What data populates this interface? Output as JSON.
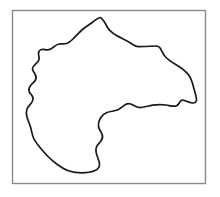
{
  "figure": {
    "title": "Hand-drawn closed outline figure",
    "background_color": "#ffffff",
    "canvas": {
      "width": 220,
      "height": 197
    },
    "frame": {
      "name": "border-rectangle",
      "x": 12.5,
      "y": 10.5,
      "width": 193,
      "height": 173,
      "stroke_color": "#8a8a8a",
      "stroke_width": 1.4,
      "fill_color": "#ffffff"
    },
    "shape": {
      "name": "region-outline",
      "stroke_color": "#1a1a1a",
      "stroke_width": 1.7,
      "fill_color": "#ffffff",
      "closed": true,
      "bounds": {
        "left": 26,
        "top": 17,
        "right": 197,
        "bottom": 173
      },
      "path": "M 100.5 17.5 C 103.5 19.5 105.5 23.5 107.5 27.5 C 110.0 31.5 113.0 33.5 116.5 35.5 C 121.0 38.0 126.0 40.0 130.5 43.0 C 133.5 45.0 135.5 46.6 138.0 46.6 C 143.0 46.6 150.0 46.3 155.5 46.0 C 158.0 45.9 159.5 46.6 160.5 48.5 C 162.0 51.5 163.5 55.0 166.0 57.5 C 169.5 61.0 174.5 63.5 179.0 66.5 C 183.0 69.2 186.5 72.0 189.0 75.5 C 191.5 79.0 192.5 83.0 193.5 87.0 C 194.5 91.0 196.0 95.0 196.5 99.0 C 196.9 102.0 195.0 103.2 192.5 103.0 C 189.5 102.8 187.0 101.5 184.5 100.5 C 182.5 99.7 181.0 100.0 180.0 101.8 C 179.0 103.6 178.0 105.5 176.0 106.0 C 173.0 106.8 169.5 105.5 166.0 105.0 C 161.5 104.4 157.0 104.5 152.5 105.2 C 148.5 105.8 145.0 107.2 141.0 107.5 C 137.5 107.8 135.5 106.5 133.0 105.0 C 130.5 103.5 128.0 103.0 125.5 104.5 C 123.0 106.0 121.0 108.5 118.0 109.8 C 114.5 111.3 110.5 111.2 107.0 112.5 C 104.0 113.6 102.0 115.5 100.5 118.0 C 99.0 120.5 98.0 123.5 98.5 126.5 C 99.0 129.5 101.0 131.5 102.0 134.0 C 103.0 136.5 102.5 139.0 101.0 141.0 C 99.5 143.0 97.5 144.5 96.5 147.0 C 95.5 149.5 96.0 152.5 97.0 155.5 C 98.0 158.5 99.5 161.5 99.5 164.5 C 99.5 167.5 97.5 169.5 94.5 170.8 C 91.0 172.3 86.5 172.8 82.0 172.8 C 77.5 172.8 73.0 172.3 69.0 171.0 C 65.0 169.7 61.5 167.5 58.0 165.0 C 54.5 162.5 51.0 159.5 48.0 156.5 C 45.0 153.5 42.5 150.5 40.0 147.5 C 37.5 144.5 35.0 141.5 33.5 138.0 C 32.0 134.5 31.5 130.5 30.5 127.0 C 29.5 123.5 28.0 120.5 27.0 117.0 C 26.2 114.2 26.0 111.5 27.0 109.0 C 28.0 106.5 30.0 104.8 31.5 102.8 C 33.0 100.8 33.5 98.5 32.5 96.5 C 31.5 94.5 29.5 93.2 29.0 91.0 C 28.5 88.8 29.5 86.8 31.0 85.0 C 32.5 83.2 34.5 82.0 35.5 80.0 C 36.5 78.0 36.0 75.8 35.0 74.0 C 34.0 72.2 32.5 70.8 32.5 68.8 C 32.5 66.8 34.0 65.5 35.5 64.2 C 37.0 62.9 38.5 61.5 39.0 59.5 C 39.5 57.5 38.5 55.5 38.5 53.5 C 38.5 51.5 39.5 50.0 41.5 49.5 C 43.5 49.0 45.5 49.8 47.5 49.8 C 49.5 49.8 51.0 49.0 52.5 47.8 C 54.5 46.2 56.5 44.5 59.0 44.0 C 61.5 43.5 64.0 44.2 66.5 43.5 C 69.0 42.8 71.0 41.0 73.0 39.0 C 76.0 36.0 79.0 32.5 82.5 29.5 C 86.0 26.5 90.0 24.0 93.5 21.5 C 96.0 19.7 98.0 17.5 100.5 17.5 Z"
    }
  }
}
